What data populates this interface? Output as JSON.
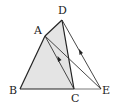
{
  "diagram": {
    "type": "geometry-figure",
    "points": {
      "A": {
        "label": "A"
      },
      "B": {
        "label": "B"
      },
      "C": {
        "label": "C"
      },
      "D": {
        "label": "D"
      },
      "E": {
        "label": "E"
      }
    },
    "segments": [
      "AB",
      "BC",
      "CE",
      "AD",
      "DC",
      "DE",
      "AC",
      "AE"
    ],
    "parallel_marked": [
      "AC",
      "DE"
    ],
    "shaded_region": "ABCD",
    "colors": {
      "shade": "#e4e4e4",
      "stroke": "#222222",
      "thin_stroke": "#555555"
    }
  }
}
